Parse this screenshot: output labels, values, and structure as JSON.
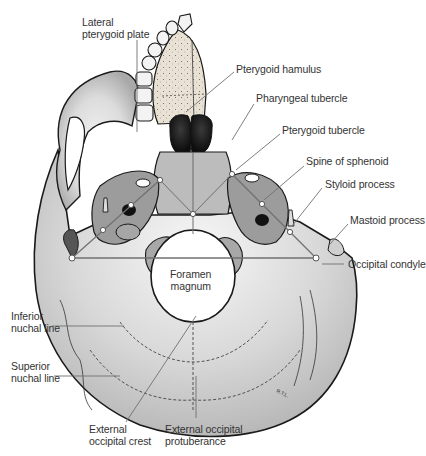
{
  "figure": {
    "signature": "R.T.L.",
    "colors": {
      "outline": "#1a1a1a",
      "bone_light": "#ececec",
      "bone_mid": "#bdbdbd",
      "bone_dark": "#7a7a7a",
      "leader_line": "#707070",
      "label_text": "#333333",
      "marker_fill": "#ffffff"
    }
  },
  "labels": {
    "lateral_pterygoid_plate": {
      "line1": "Lateral",
      "line2": "pterygoid plate"
    },
    "pterygoid_hamulus": {
      "line1": "Pterygoid hamulus"
    },
    "pharyngeal_tubercle": {
      "line1": "Pharyngeal tubercle"
    },
    "pterygoid_tubercle": {
      "line1": "Pterygoid tubercle"
    },
    "spine_of_sphenoid": {
      "line1": "Spine of sphenoid"
    },
    "styloid_process": {
      "line1": "Styloid process"
    },
    "mastoid_process": {
      "line1": "Mastoid process"
    },
    "occipital_condyle": {
      "line1": "Occipital condyle"
    },
    "foramen_magnum": {
      "line1": "Foramen",
      "line2": "magnum"
    },
    "inferior_nuchal_line": {
      "line1": "Inferior",
      "line2": "nuchal line"
    },
    "superior_nuchal_line": {
      "line1": "Superior",
      "line2": "nuchal line"
    },
    "external_occipital_crest": {
      "line1": "External",
      "line2": "occipital crest"
    },
    "external_occipital_protuberance": {
      "line1": "External occipital",
      "line2": "protuberance"
    }
  }
}
